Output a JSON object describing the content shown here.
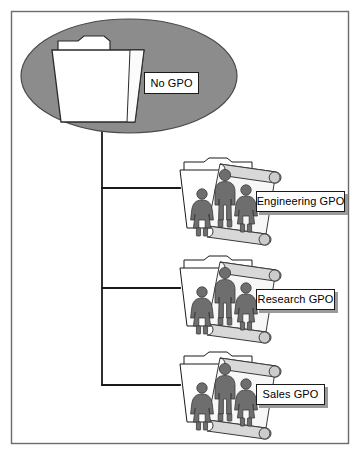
{
  "diagram": {
    "frame": {
      "border_color": "#6b6b6b",
      "background_color": "#ffffff"
    },
    "connector": {
      "color": "#1a1a1a",
      "style": "elbow-tree"
    },
    "palette": {
      "ellipse_fill": "#8c8c8c",
      "ellipse_stroke": "#4a4a4a",
      "folder_fill": "#ffffff",
      "folder_stroke": "#1a1a1a",
      "person_fill": "#6e6e6e",
      "person_stroke": "#3a3a3a",
      "scroll_fill": "#f2f2f2",
      "scroll_stroke": "#3a3a3a",
      "label_shadow": "#9a9a9a"
    },
    "root": {
      "label": "No GPO",
      "icon": "folder-icon",
      "container_icon": "ellipse-container-icon"
    },
    "children": [
      {
        "label": "Engineering GPO",
        "icon": "folder-with-policy-icon",
        "people_count": 3
      },
      {
        "label": "Research GPO",
        "icon": "folder-with-policy-icon",
        "people_count": 3
      },
      {
        "label": "Sales GPO",
        "icon": "folder-with-policy-icon",
        "people_count": 3
      }
    ]
  }
}
